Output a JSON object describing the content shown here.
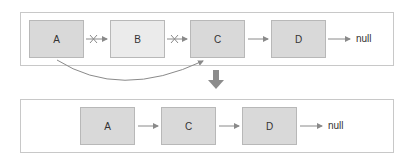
{
  "before": {
    "nodes": [
      {
        "label": "A"
      },
      {
        "label": "B"
      },
      {
        "label": "C"
      },
      {
        "label": "D"
      }
    ],
    "terminator": "null",
    "broken_links": [
      "A-B",
      "B-C"
    ],
    "bypass_link": "A-C"
  },
  "after": {
    "nodes": [
      {
        "label": "A"
      },
      {
        "label": "C"
      },
      {
        "label": "D"
      }
    ],
    "terminator": "null"
  },
  "colors": {
    "node_fill_dark": "#d9d9d9",
    "node_fill_light": "#ebebeb",
    "arrow": "#8a8a8a",
    "transition_arrow": "#8c8c8c",
    "border": "#c8c8c8"
  }
}
